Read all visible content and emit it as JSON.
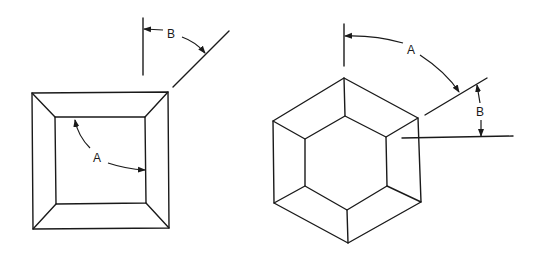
{
  "diagram": {
    "figures": [
      {
        "name": "square-frustum-top-view",
        "labels": {
          "angle_a": "A",
          "angle_b": "B"
        }
      },
      {
        "name": "hexagonal-frustum-top-view",
        "labels": {
          "angle_a": "A",
          "angle_b": "B"
        }
      }
    ],
    "colors": {
      "line": "#1a1a1a",
      "background": "#ffffff"
    }
  }
}
